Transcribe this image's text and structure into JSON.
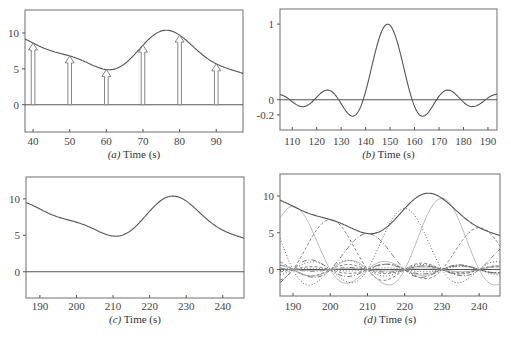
{
  "chart_data": [
    {
      "id": "a",
      "type": "line",
      "caption_prefix": "(a)",
      "caption_suffix": " Time (s)",
      "xlabel": "Time (s)",
      "xlim": [
        37.8,
        97.3
      ],
      "ylim": [
        -3.8,
        13.2
      ],
      "xticks": [
        40,
        50,
        60,
        70,
        80,
        90
      ],
      "yticks": [
        0,
        5,
        10
      ],
      "curve": {
        "name": "continuous signal",
        "kind": "sinc-interpolated",
        "sample_spacing": 10,
        "sample_times": [
          10,
          20,
          30,
          40,
          50,
          60,
          70,
          80,
          90,
          100,
          110,
          120
        ],
        "sample_values": [
          9.6,
          10.3,
          9.8,
          8.6,
          6.8,
          4.9,
          8.3,
          9.7,
          5.7,
          3.9,
          3.4,
          3.2
        ]
      },
      "samples": {
        "name": "sampled values (arrows)",
        "x": [
          40,
          50,
          60,
          70,
          80,
          90
        ],
        "y": [
          8.6,
          6.8,
          4.9,
          8.3,
          9.7,
          5.7
        ]
      }
    },
    {
      "id": "b",
      "type": "line",
      "caption_prefix": "(b)",
      "caption_suffix": " Time (s)",
      "xlabel": "Time (s)",
      "xlim": [
        105,
        193.7
      ],
      "ylim": [
        -0.4,
        1.2
      ],
      "xticks": [
        110,
        120,
        130,
        140,
        150,
        160,
        170,
        180,
        190
      ],
      "yticks": [
        -0.2,
        0,
        1
      ],
      "ytick_labels": [
        "-0.2",
        "0",
        "1"
      ],
      "curve": {
        "name": "sinc interpolation kernel",
        "kind": "sinc",
        "center": 149,
        "zero_spacing": 10,
        "amplitude": 1
      }
    },
    {
      "id": "c",
      "type": "line",
      "caption_prefix": "(c)",
      "caption_suffix": " Time (s)",
      "xlabel": "Time (s)",
      "xlim": [
        186.2,
        245.8
      ],
      "ylim": [
        -3.6,
        13.0
      ],
      "xticks": [
        190,
        200,
        210,
        220,
        230,
        240
      ],
      "yticks": [
        0,
        5,
        10
      ],
      "curve": {
        "name": "reconstructed signal",
        "kind": "sinc-interpolated",
        "sample_spacing": 10,
        "sample_times": [
          160,
          170,
          180,
          190,
          200,
          210,
          220,
          230,
          240,
          250,
          260,
          270
        ],
        "sample_values": [
          9.6,
          10.3,
          9.8,
          8.6,
          6.8,
          4.9,
          8.3,
          9.7,
          5.7,
          3.9,
          3.4,
          3.2
        ]
      }
    },
    {
      "id": "d",
      "type": "line",
      "caption_prefix": "(d)",
      "caption_suffix": " Time (s)",
      "xlabel": "Time (s)",
      "xlim": [
        186.5,
        245.6
      ],
      "ylim": [
        -3.6,
        13.0
      ],
      "xticks": [
        190,
        200,
        210,
        220,
        230,
        240
      ],
      "yticks": [
        0,
        5,
        10
      ],
      "curve": {
        "name": "sum of scaled sinc functions",
        "kind": "sinc-interpolated",
        "sample_spacing": 10,
        "sample_times": [
          160,
          170,
          180,
          190,
          200,
          210,
          220,
          230,
          240,
          250,
          260,
          270
        ],
        "sample_values": [
          9.6,
          10.3,
          9.8,
          8.6,
          6.8,
          4.9,
          8.3,
          9.7,
          5.7,
          3.9,
          3.4,
          3.2
        ]
      },
      "components": {
        "name": "individual scaled sinc functions",
        "line_styles": [
          "dashed",
          "dash-dot",
          "dotted",
          "solid-light"
        ]
      }
    }
  ]
}
